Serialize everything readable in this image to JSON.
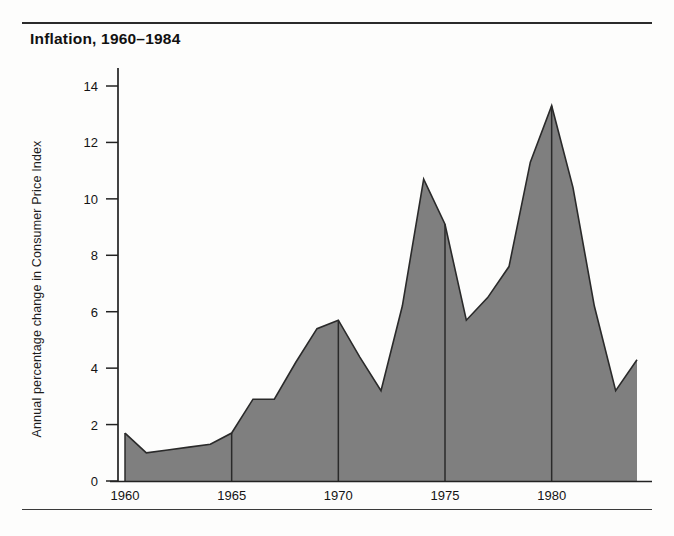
{
  "title": "Inflation, 1960–1984",
  "colors": {
    "area_fill": "#7f7f7f",
    "area_stroke": "#2a2a2a",
    "axis": "#222222",
    "rule": "#2b2b2b",
    "text": "#141414",
    "background": "#fdfdfc"
  },
  "axes": {
    "y_label": "Annual percentage change in Consumer Price Index",
    "x_label": "",
    "y_ticks": [
      "0",
      "2",
      "4",
      "6",
      "8",
      "10",
      "12",
      "14"
    ],
    "x_ticks": [
      "1960",
      "1965",
      "1970",
      "1975",
      "1980"
    ]
  },
  "chart_data": {
    "type": "area",
    "title": "Inflation, 1960–1984",
    "xlabel": "",
    "ylabel": "Annual percentage change in Consumer Price Index",
    "xlim": [
      1960,
      1984
    ],
    "ylim": [
      0,
      15
    ],
    "ytick_values": [
      0,
      2,
      4,
      6,
      8,
      10,
      12,
      14
    ],
    "xtick_values": [
      1960,
      1965,
      1970,
      1975,
      1980
    ],
    "grid": false,
    "legend": "none",
    "x": [
      1960,
      1961,
      1962,
      1963,
      1964,
      1965,
      1966,
      1967,
      1968,
      1969,
      1970,
      1971,
      1972,
      1973,
      1974,
      1975,
      1976,
      1977,
      1978,
      1979,
      1980,
      1981,
      1982,
      1983,
      1984
    ],
    "values": [
      1.7,
      1.0,
      1.1,
      1.2,
      1.3,
      1.7,
      2.9,
      2.9,
      4.2,
      5.4,
      5.7,
      4.4,
      3.2,
      6.2,
      10.7,
      9.1,
      5.7,
      6.5,
      7.6,
      11.3,
      13.3,
      10.4,
      6.2,
      3.2,
      4.3
    ],
    "series": [
      {
        "name": "Annual percentage change in Consumer Price Index",
        "values": [
          1.7,
          1.0,
          1.1,
          1.2,
          1.3,
          1.7,
          2.9,
          2.9,
          4.2,
          5.4,
          5.7,
          4.4,
          3.2,
          6.2,
          10.7,
          9.1,
          5.7,
          6.5,
          7.6,
          11.3,
          13.3,
          10.4,
          6.2,
          3.2,
          4.3
        ]
      }
    ],
    "annotations": []
  }
}
